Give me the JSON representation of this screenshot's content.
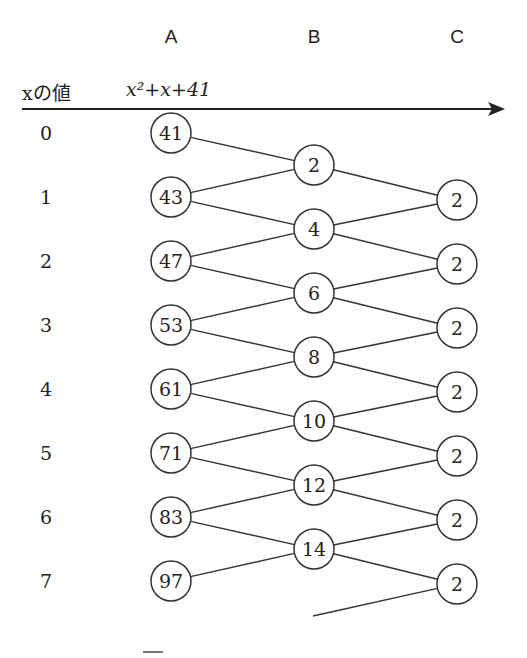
{
  "columns": {
    "a": "A",
    "b": "B",
    "c": "C"
  },
  "header": {
    "x_label": "xの値",
    "formula": "x²+x+41"
  },
  "x_values": [
    "0",
    "1",
    "2",
    "3",
    "4",
    "5",
    "6",
    "7"
  ],
  "column_a": [
    "41",
    "43",
    "47",
    "53",
    "61",
    "71",
    "83",
    "97"
  ],
  "column_b": [
    "2",
    "4",
    "6",
    "8",
    "10",
    "12",
    "14"
  ],
  "column_c": [
    "2",
    "2",
    "2",
    "2",
    "2",
    "2",
    "2"
  ],
  "caption_partial": "図"
}
